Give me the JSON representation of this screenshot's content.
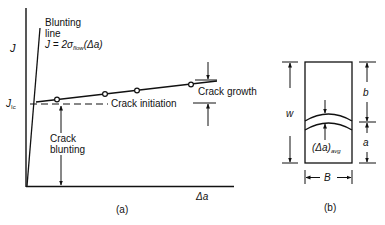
{
  "panel_a": {
    "caption": "(a)",
    "y_axis_label": "J",
    "x_axis_label": "Δa",
    "jic_label": "J",
    "jic_sub": "Ic",
    "blunting_title_1": "Blunting",
    "blunting_title_2": "line",
    "blunting_eq_pre": "J = 2σ",
    "blunting_eq_sub": "flow",
    "blunting_eq_post": "(Δa)",
    "crack_growth_label": "Crack growth",
    "crack_initiation_label": "Crack initiation",
    "crack_blunting_label_1": "Crack",
    "crack_blunting_label_2": "blunting",
    "data_points": [
      [
        57,
        99
      ],
      [
        105,
        93
      ],
      [
        137,
        90
      ],
      [
        191,
        85
      ]
    ]
  },
  "panel_b": {
    "caption": "(b)",
    "w_label": "w",
    "b_label": "b",
    "a_label": "a",
    "B_label": "B",
    "delta_a_pre": "(Δa)",
    "delta_a_sub": "avg"
  },
  "colors": {
    "ink": "#111111",
    "background": "#ffffff"
  }
}
